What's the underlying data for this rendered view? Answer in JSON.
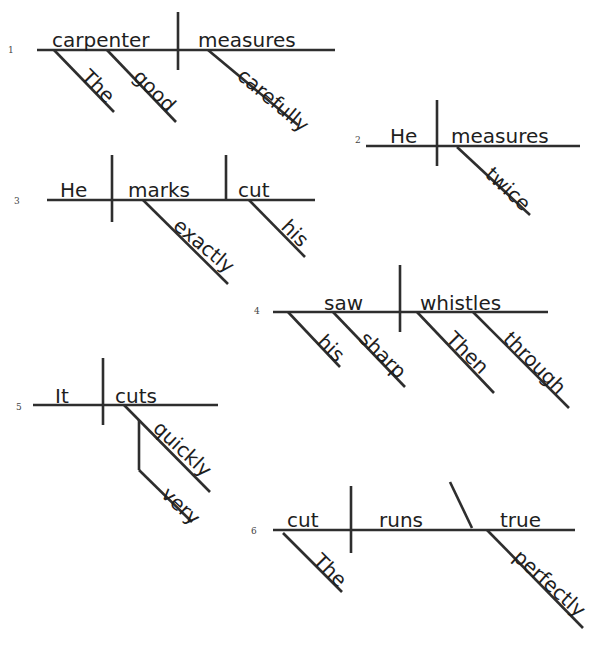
{
  "style": {
    "line_color": "#2e2e2e",
    "text_color": "#1e1e1e",
    "background": "#ffffff",
    "stroke_width": 2.6
  },
  "diagrams": [
    {
      "number": "1",
      "number_pos": [
        8,
        45
      ],
      "lines": [
        [
          37,
          50,
          335,
          50
        ],
        [
          178,
          12,
          178,
          70
        ],
        [
          54,
          50,
          114,
          112
        ],
        [
          107,
          50,
          176,
          122
        ],
        [
          208,
          50,
          298,
          125
        ]
      ],
      "words": [
        {
          "text": "carpenter",
          "x": 52,
          "y": 30,
          "angle": 0
        },
        {
          "text": "measures",
          "x": 198,
          "y": 30,
          "angle": 0
        },
        {
          "text": "The",
          "x": 78,
          "y": 60,
          "angle": 45
        },
        {
          "text": "good",
          "x": 130,
          "y": 60,
          "angle": 45
        },
        {
          "text": "carefully",
          "x": 234,
          "y": 60,
          "angle": 40
        }
      ]
    },
    {
      "number": "2",
      "number_pos": [
        355,
        135
      ],
      "lines": [
        [
          366,
          146,
          580,
          146
        ],
        [
          437,
          100,
          437,
          166
        ],
        [
          457,
          147,
          530,
          215
        ]
      ],
      "words": [
        {
          "text": "He",
          "x": 390,
          "y": 126,
          "angle": 0
        },
        {
          "text": "measures",
          "x": 451,
          "y": 126,
          "angle": 0
        },
        {
          "text": "twice",
          "x": 482,
          "y": 158,
          "angle": 43
        }
      ]
    },
    {
      "number": "3",
      "number_pos": [
        14,
        196
      ],
      "lines": [
        [
          47,
          200,
          315,
          200
        ],
        [
          112,
          155,
          112,
          222
        ],
        [
          226,
          155,
          226,
          200
        ],
        [
          143,
          200,
          228,
          284
        ],
        [
          249,
          200,
          305,
          257
        ]
      ],
      "words": [
        {
          "text": "He",
          "x": 60,
          "y": 180,
          "angle": 0
        },
        {
          "text": "marks",
          "x": 128,
          "y": 180,
          "angle": 0
        },
        {
          "text": "cut",
          "x": 238,
          "y": 180,
          "angle": 0
        },
        {
          "text": "exactly",
          "x": 170,
          "y": 210,
          "angle": 40
        },
        {
          "text": "his",
          "x": 278,
          "y": 210,
          "angle": 45
        }
      ]
    },
    {
      "number": "4",
      "number_pos": [
        254,
        306
      ],
      "lines": [
        [
          273,
          312,
          548,
          312
        ],
        [
          400,
          265,
          400,
          332
        ],
        [
          288,
          312,
          340,
          367
        ],
        [
          333,
          312,
          405,
          387
        ],
        [
          417,
          312,
          494,
          393
        ],
        [
          473,
          312,
          569,
          408
        ]
      ],
      "words": [
        {
          "text": "saw",
          "x": 324,
          "y": 293,
          "angle": 0
        },
        {
          "text": "whistles",
          "x": 420,
          "y": 293,
          "angle": 0
        },
        {
          "text": "his",
          "x": 314,
          "y": 325,
          "angle": 45
        },
        {
          "text": "sharp",
          "x": 356,
          "y": 322,
          "angle": 45
        },
        {
          "text": "Then",
          "x": 443,
          "y": 322,
          "angle": 45
        },
        {
          "text": "through",
          "x": 500,
          "y": 322,
          "angle": 45
        }
      ]
    },
    {
      "number": "5",
      "number_pos": [
        16,
        402
      ],
      "lines": [
        [
          33,
          405,
          218,
          405
        ],
        [
          103,
          358,
          103,
          425
        ],
        [
          124,
          405,
          210,
          492
        ],
        [
          139,
          420,
          139,
          470
        ],
        [
          139,
          470,
          192,
          522
        ]
      ],
      "words": [
        {
          "text": "It",
          "x": 55,
          "y": 386,
          "angle": 0
        },
        {
          "text": "cuts",
          "x": 115,
          "y": 386,
          "angle": 0
        },
        {
          "text": "quickly",
          "x": 150,
          "y": 412,
          "angle": 43
        },
        {
          "text": "very",
          "x": 158,
          "y": 478,
          "angle": 43
        }
      ]
    },
    {
      "number": "6",
      "number_pos": [
        251,
        526
      ],
      "lines": [
        [
          273,
          530,
          575,
          530
        ],
        [
          351,
          486,
          351,
          553
        ],
        [
          450,
          482,
          472,
          528
        ],
        [
          283,
          533,
          342,
          592
        ],
        [
          487,
          530,
          583,
          628
        ]
      ],
      "words": [
        {
          "text": "cut",
          "x": 287,
          "y": 510,
          "angle": 0
        },
        {
          "text": "runs",
          "x": 379,
          "y": 510,
          "angle": 0
        },
        {
          "text": "true",
          "x": 500,
          "y": 510,
          "angle": 0
        },
        {
          "text": "The",
          "x": 310,
          "y": 544,
          "angle": 45
        },
        {
          "text": "perfectly",
          "x": 510,
          "y": 541,
          "angle": 42
        }
      ]
    }
  ]
}
